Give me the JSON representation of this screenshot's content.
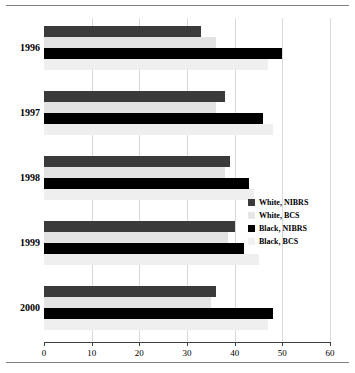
{
  "chart_data": {
    "type": "bar",
    "orientation": "horizontal",
    "title": "",
    "subtitle": "",
    "xlabel": "",
    "ylabel": "",
    "categories": [
      "1996",
      "1997",
      "1998",
      "1999",
      "2000"
    ],
    "xlim": [
      0,
      60
    ],
    "xticks": [
      0,
      10,
      20,
      30,
      40,
      50,
      60
    ],
    "xtick_labels": [
      "0",
      "10",
      "20",
      "30",
      "40",
      "50",
      "60"
    ],
    "grid": true,
    "grid_axis": "x",
    "legend_position": "center-right",
    "series": [
      {
        "name": "White, NIBRS",
        "color": "#3a3a3a",
        "values": [
          33,
          38,
          39,
          40,
          36
        ]
      },
      {
        "name": "White, BCS",
        "color": "#e3e3e3",
        "values": [
          36,
          36,
          38,
          38.5,
          35
        ]
      },
      {
        "name": "Black, NIBRS",
        "color": "#000000",
        "values": [
          50,
          46,
          43,
          42,
          48
        ]
      },
      {
        "name": "Black, BCS",
        "color": "#efefef",
        "values": [
          47,
          48,
          44,
          45,
          47
        ]
      }
    ]
  },
  "legend": {
    "items": [
      {
        "label": "White, NIBRS"
      },
      {
        "label": "White, BCS"
      },
      {
        "label": "Black, NIBRS"
      },
      {
        "label": "Black, BCS"
      }
    ]
  }
}
